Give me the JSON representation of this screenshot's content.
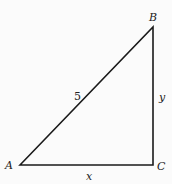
{
  "diagram": {
    "type": "right-triangle",
    "vertices": {
      "A": {
        "label": "A",
        "x": 20,
        "y": 165
      },
      "B": {
        "label": "B",
        "x": 153,
        "y": 27
      },
      "C": {
        "label": "C",
        "x": 153,
        "y": 165
      }
    },
    "sides": {
      "AB": {
        "label": "5"
      },
      "BC": {
        "label": "y"
      },
      "AC": {
        "label": "x"
      }
    },
    "line_color": "#1a1a1a",
    "background": "#fbfbfb"
  }
}
